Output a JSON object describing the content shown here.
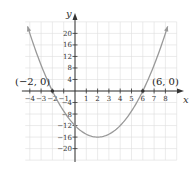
{
  "chart_data": {
    "type": "line",
    "title": "",
    "xlabel": "x",
    "ylabel": "y",
    "xlim": [
      -5,
      9
    ],
    "ylim": [
      -24,
      24
    ],
    "grid": true,
    "x_ticks": [
      -4,
      -3,
      -2,
      -1,
      1,
      2,
      3,
      4,
      5,
      6,
      7,
      8
    ],
    "y_ticks": [
      20,
      16,
      12,
      8,
      4,
      -4,
      -8,
      -12,
      -16,
      -20
    ],
    "x_tick_labels": [
      "−4",
      "−3",
      "−2",
      "−1",
      "1",
      "2",
      "3",
      "4",
      "5",
      "6",
      "7",
      "8"
    ],
    "y_tick_labels": [
      "20",
      "16",
      "12",
      "8",
      "4",
      "−4",
      "−8",
      "−12",
      "−16",
      "−20"
    ],
    "series": [
      {
        "name": "y = (x + 2)(x − 6)",
        "equation": "x^2 - 4x - 12",
        "vertex": [
          2,
          -16
        ],
        "y_intercept": [
          0,
          -12
        ],
        "x_domain": [
          -4.2,
          8.2
        ],
        "color": "#999999"
      }
    ],
    "annotations": [
      {
        "label": "(−2, 0)",
        "x": -2,
        "y": 0
      },
      {
        "label": "(6, 0)",
        "x": 6,
        "y": 0
      }
    ]
  },
  "labels": {
    "x_axis": "x",
    "y_axis": "y",
    "point_left": "(−2, 0)",
    "point_right": "(6, 0)"
  },
  "colors": {
    "grid": "#dddddd",
    "axis": "#333333",
    "curve": "#999999"
  }
}
